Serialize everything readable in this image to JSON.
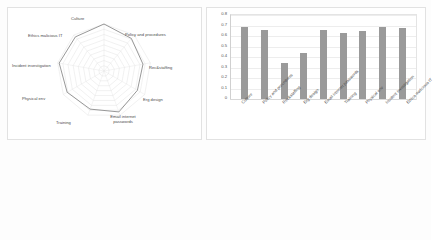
{
  "chart_data": [
    {
      "type": "line",
      "subtype": "radar",
      "title": "",
      "categories": [
        "Culture",
        "Policy and procedures",
        "Rec&staffing",
        "Erg design",
        "Email internet passwords",
        "Training",
        "Physical env",
        "Incident investigation",
        "Ethics malicious IT"
      ],
      "values": [
        0.95,
        0.86,
        0.8,
        0.78,
        0.88,
        0.82,
        0.86,
        0.92,
        0.9
      ],
      "rings": 9,
      "grid": true,
      "legend": "none",
      "xlabel": "",
      "ylabel": "",
      "line_color": "#8c8c8c",
      "grid_color": "#d9d9d9"
    },
    {
      "type": "bar",
      "title": "",
      "categories": [
        "Culture",
        "Policy and procedures",
        "Rec&staffing",
        "Erg design",
        "Email internet passwords",
        "Training",
        "Physical env",
        "Incident investigation",
        "Ethics malicious IT"
      ],
      "values": [
        0.69,
        0.66,
        0.34,
        0.44,
        0.66,
        0.63,
        0.65,
        0.69,
        0.68
      ],
      "yticks": [
        "0.8",
        "0.7",
        "0.6",
        "0.5",
        "0.4",
        "0.3",
        "0.2",
        "0.1",
        "0"
      ],
      "ylim": [
        0,
        0.8
      ],
      "xlabel": "",
      "ylabel": "",
      "grid": true,
      "legend": "none",
      "bar_color": "#9a9a9a",
      "grid_color": "#ededed"
    }
  ]
}
